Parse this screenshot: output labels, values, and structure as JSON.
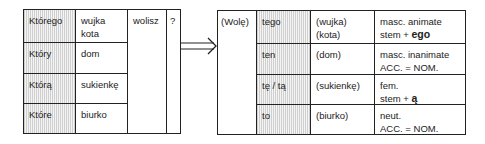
{
  "left_table": {
    "rows": [
      {
        "pronoun": "Którego",
        "noun_line1": "wujka",
        "noun_line2": "kota"
      },
      {
        "pronoun": "Który",
        "noun_line1": "dom",
        "noun_line2": ""
      },
      {
        "pronoun": "Którą",
        "noun_line1": "sukienkę",
        "noun_line2": ""
      },
      {
        "pronoun": "Które",
        "noun_line1": "biurko",
        "noun_line2": ""
      }
    ],
    "verb": "wolisz",
    "question_mark": "?"
  },
  "arrow": {
    "icon": "double-arrow-right-icon"
  },
  "right_table": {
    "verb": "(Wolę)",
    "rows": [
      {
        "demonstrative": "tego",
        "noun_line1": "(wujka)",
        "noun_line2": "(kota)",
        "note_line1": "masc. animate",
        "note_line2_prefix": "stem + ",
        "note_line2_emph": "ego"
      },
      {
        "demonstrative": "ten",
        "noun_line1": "(dom)",
        "noun_line2": "",
        "note_line1": "masc. inanimate",
        "note_line2_prefix": "ACC. = NOM.",
        "note_line2_emph": ""
      },
      {
        "demonstrative": "tę / tą",
        "noun_line1": "(sukienkę)",
        "noun_line2": "",
        "note_line1": "fem.",
        "note_line2_prefix": "stem + ",
        "note_line2_emph": "ą"
      },
      {
        "demonstrative": "to",
        "noun_line1": "(biurko)",
        "noun_line2": "",
        "note_line1": "neut.",
        "note_line2_prefix": "ACC. = NOM.",
        "note_line2_emph": ""
      }
    ]
  }
}
